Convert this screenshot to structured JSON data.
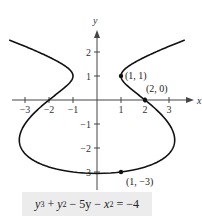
{
  "chart_data": {
    "type": "line",
    "title": "",
    "equation": "y^3 + y^2 - 5y - x^2 = -4",
    "xlabel": "x",
    "ylabel": "y",
    "xlim": [
      -3.8,
      3.8
    ],
    "ylim": [
      -3.3,
      3.0
    ],
    "x_ticks": [
      -3,
      -2,
      -1,
      1,
      2,
      3
    ],
    "y_ticks": [
      -3,
      -2,
      -1,
      1,
      2
    ],
    "grid": false,
    "curve": {
      "description": "x = ±sqrt(y^3 + y^2 - 5y + 4), y from about -3.06 to 2.5",
      "y_min": -3.06,
      "y_max": 2.5
    },
    "points": [
      {
        "x": 1,
        "y": 1,
        "label": "(1, 1)"
      },
      {
        "x": 2,
        "y": 0,
        "label": "(2, 0)"
      },
      {
        "x": 1,
        "y": -3,
        "label": "(1, −3)"
      }
    ],
    "colors": {
      "curve": "#111111",
      "axis": "#444444",
      "equation_bg": "#ececec"
    }
  },
  "equation_parts": {
    "y3": "y",
    "p3": "3",
    "plus1": " + ",
    "y2": "y",
    "p2": "2",
    "rest1": " − 5y − ",
    "x2": "x",
    "px2": "2",
    "rest2": " = −4"
  }
}
